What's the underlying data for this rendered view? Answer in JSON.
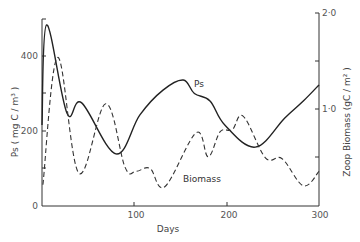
{
  "chart_data": {
    "type": "line",
    "title": "",
    "xlabel": "Days",
    "ylabel": "Ps (mg C / m³)",
    "y2label": "Zoop Biomass (gC / m²)",
    "xlim": [
      0,
      300
    ],
    "ylim": [
      0,
      500
    ],
    "y2lim": [
      0,
      2.0
    ],
    "x_ticks": [
      0,
      100,
      200,
      300
    ],
    "x_tick_labels": [
      "0",
      "100",
      "200",
      "300"
    ],
    "y_ticks": [
      0,
      100,
      200,
      300,
      400
    ],
    "y_tick_labels": [
      "0",
      "",
      "200",
      "",
      "400"
    ],
    "y2_ticks": [
      0.5,
      1.0,
      1.5,
      2.0
    ],
    "y2_tick_labels": [
      "",
      "1·0",
      "",
      "2·0"
    ],
    "grid": false,
    "legend": "inline labels",
    "series": [
      {
        "name": "Ps",
        "axis": "left",
        "style": "solid",
        "color": "#222222",
        "x": [
          0,
          5,
          27,
          43,
          80,
          106,
          131,
          153,
          165,
          182,
          198,
          231,
          263,
          283,
          300
        ],
        "values": [
          216,
          483,
          248,
          275,
          139,
          243,
          309,
          336,
          300,
          280,
          216,
          157,
          235,
          280,
          323
        ]
      },
      {
        "name": "Biomass",
        "axis": "right",
        "style": "dashed",
        "color": "#333333",
        "x": [
          1,
          17,
          40,
          69,
          90,
          102,
          117,
          133,
          167,
          180,
          193,
          206,
          218,
          242,
          260,
          283,
          300
        ],
        "values": [
          0.22,
          1.54,
          0.34,
          1.06,
          0.4,
          0.36,
          0.39,
          0.2,
          0.76,
          0.51,
          0.77,
          0.79,
          0.93,
          0.5,
          0.49,
          0.21,
          0.36
        ]
      }
    ],
    "annotations": [
      {
        "text": "Ps",
        "x": 156,
        "y": 330
      },
      {
        "text": "Biomass",
        "x": 125,
        "y": 0.34
      }
    ]
  },
  "labels": {
    "xlabel": "Days",
    "ylabel": "Ps  ( mg  C / m³ )",
    "y2label": "Zoop  Biomass  (gC / m² )",
    "ps_label": "Ps",
    "biomass_label": "Biomass",
    "x0": "0",
    "x100": "100",
    "x200": "200",
    "x300": "300",
    "y0": "0",
    "y200": "200",
    "y400": "400",
    "r1": "1·0",
    "r2": "2·0"
  }
}
